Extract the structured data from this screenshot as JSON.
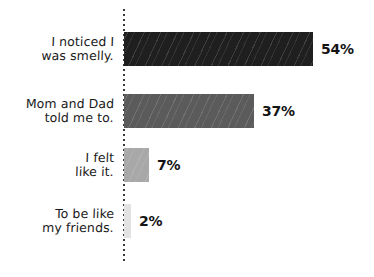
{
  "chart_data": {
    "type": "bar",
    "orientation": "horizontal",
    "title": "",
    "subtitle": "",
    "xlabel": "",
    "ylabel": "",
    "xlim": [
      0,
      54
    ],
    "grid": false,
    "legend": null,
    "categories": [
      "I noticed I\nwas smelly.",
      "Mom and Dad\ntold me to.",
      "I felt\nlike it.",
      "To be like\nmy friends."
    ],
    "values": [
      54,
      37,
      7,
      2
    ],
    "value_labels": [
      "54%",
      "37%",
      "7%",
      "2%"
    ],
    "bar_colors": [
      "#1f1f1f",
      "#5b5b5b",
      "#a8a8a8",
      "#e2e2e2"
    ],
    "bar_texture": "diagonal-hatch",
    "axis_style": "dotted-vertical-baseline",
    "background_color": "#ffffff",
    "text_color": "#1a1a1a"
  },
  "bars": [
    {
      "label": "I noticed I\nwas smelly.",
      "value_label": "54%",
      "value": 54,
      "color": "#1f1f1f"
    },
    {
      "label": "Mom and Dad\ntold me to.",
      "value_label": "37%",
      "value": 37,
      "color": "#5b5b5b"
    },
    {
      "label": "I felt\nlike it.",
      "value_label": "7%",
      "value": 7,
      "color": "#a8a8a8"
    },
    {
      "label": "To be like\nmy friends.",
      "value_label": "2%",
      "value": 2,
      "color": "#e2e2e2"
    }
  ],
  "geometry": {
    "axis_x": 124,
    "max_bar_px": 189,
    "bar_height": 34,
    "rows_top": [
      32,
      94,
      148,
      204
    ],
    "label_gap": 8
  }
}
